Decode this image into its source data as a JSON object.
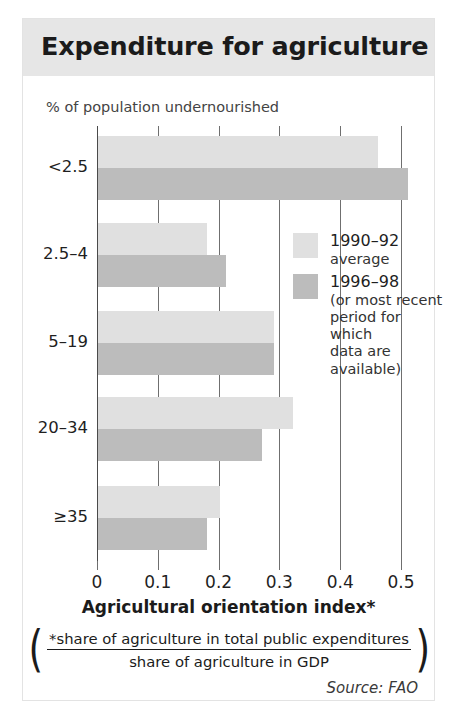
{
  "header": {
    "title": "Expenditure for agriculture"
  },
  "chart_data": {
    "type": "bar",
    "orientation": "horizontal",
    "title": "Expenditure for agriculture",
    "ylabel": "% of population undernourished",
    "xlabel": "Agricultural orientation index*",
    "categories": [
      "<2.5",
      "2.5–4",
      "5–19",
      "20–34",
      "≥35"
    ],
    "series": [
      {
        "name": "1990–92 average",
        "values": [
          0.46,
          0.18,
          0.29,
          0.32,
          0.2
        ],
        "color": "#e0e0e0"
      },
      {
        "name": "1996–98 (or most recent period for which data are available)",
        "values": [
          0.51,
          0.21,
          0.29,
          0.27,
          0.18
        ],
        "color": "#bcbcbc"
      }
    ],
    "xlim": [
      0,
      0.5
    ],
    "xticks": [
      0,
      0.1,
      0.2,
      0.3,
      0.4,
      0.5
    ],
    "xtick_labels": [
      "0",
      "0.1",
      "0.2",
      "0.3",
      "0.4",
      "0.5"
    ],
    "grid": true,
    "legend_position": "inside-right"
  },
  "legend": {
    "entries": [
      {
        "label": "1990–92",
        "sub": [
          "average"
        ]
      },
      {
        "label": "1996–98",
        "sub": [
          "(or most recent",
          "period for which",
          "data are available)"
        ]
      }
    ]
  },
  "axis": {
    "ylabel_caption": "% of population undernourished",
    "xaxis_title": "Agricultural orientation index*"
  },
  "formula": {
    "open_paren": "(",
    "numerator": "*share of agriculture in total public expenditures",
    "denominator": "share of agriculture in GDP",
    "close_paren": ")"
  },
  "footer": {
    "source": "Source: FAO"
  },
  "colors": {
    "header_band": "#e6e6e6",
    "series_1990": "#e0e0e0",
    "series_1996": "#bcbcbc",
    "gridline": "#6f6f6f",
    "text": "#1b1b1b"
  }
}
